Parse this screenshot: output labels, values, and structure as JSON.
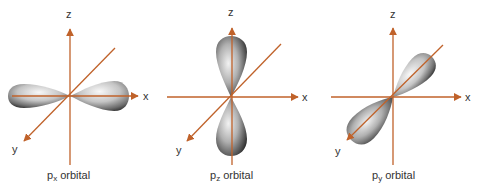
{
  "figure": {
    "title": "",
    "axis_color": "#c0622a",
    "lobe_colors": {
      "highlight": "#f4f4f4",
      "mid": "#a8a8a8",
      "shadow": "#3a3a3a"
    },
    "panels": [
      {
        "id": "px",
        "caption_main": "p",
        "caption_sub": "x",
        "caption_rest": " orbital",
        "axis_labels": {
          "x": "x",
          "y": "y",
          "z": "z"
        },
        "orientation": "along x-axis"
      },
      {
        "id": "pz",
        "caption_main": "p",
        "caption_sub": "z",
        "caption_rest": " orbital",
        "axis_labels": {
          "x": "x",
          "y": "y",
          "z": "z"
        },
        "orientation": "along z-axis"
      },
      {
        "id": "py",
        "caption_main": "p",
        "caption_sub": "y",
        "caption_rest": " orbital",
        "axis_labels": {
          "x": "x",
          "y": "y",
          "z": "z"
        },
        "orientation": "along y-axis"
      }
    ]
  }
}
